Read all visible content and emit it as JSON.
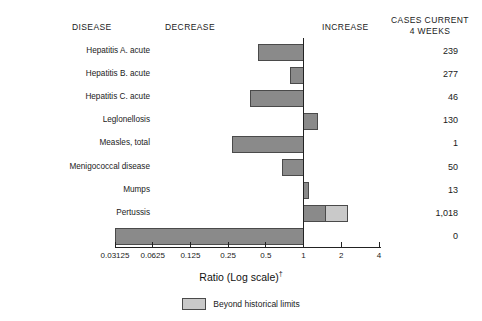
{
  "header": {
    "disease": "DISEASE",
    "decrease": "DECREASE",
    "increase": "INCREASE",
    "cases_line1": "CASES CURRENT",
    "cases_line2": "4 WEEKS"
  },
  "axis": {
    "title": "Ratio (Log scale)",
    "title_dagger": "†",
    "ticks": [
      "0.03125",
      "0.0625",
      "0.125",
      "0.25",
      "0.5",
      "1",
      "2",
      "4"
    ],
    "tick_values": [
      0.03125,
      0.0625,
      0.125,
      0.25,
      0.5,
      1,
      2,
      4
    ]
  },
  "legend": {
    "label": "Beyond historical limits",
    "swatch_color": "#c9c9c9"
  },
  "colors": {
    "bar": "#8a8a8a",
    "bar_border": "#4a4a4a",
    "beyond": "#c9c9c9",
    "axis": "#222222",
    "baseline": "#222222"
  },
  "chart_data": {
    "type": "bar",
    "orientation": "horizontal",
    "title": "",
    "xlabel": "Ratio (Log scale)†",
    "ylabel": "",
    "xscale": "log2",
    "xlim": [
      0.03125,
      4
    ],
    "baseline": 1,
    "grid": false,
    "legend_position": "bottom",
    "categories": [
      "Hepatitis A. acute",
      "Hepatitis B. acute",
      "Hepatitis C. acute",
      "Leglonellosis",
      "Measles, total",
      "Menigococcal disease",
      "Mumps",
      "Pertussis",
      "Rubella*"
    ],
    "cases_current_4_weeks": [
      "239",
      "277",
      "46",
      "130",
      "1",
      "50",
      "13",
      "1,018",
      "0"
    ],
    "values": [
      0.44,
      0.78,
      0.38,
      1.3,
      0.27,
      0.68,
      1.1,
      2.25,
      0.03125
    ],
    "series": [
      {
        "name": "Ratio",
        "values": [
          0.44,
          0.78,
          0.38,
          1.3,
          0.27,
          0.68,
          1.1,
          1.5,
          0.03125
        ]
      },
      {
        "name": "Beyond historical limits",
        "values": [
          null,
          null,
          null,
          null,
          null,
          null,
          null,
          2.25,
          null
        ]
      }
    ],
    "bars": [
      {
        "label": "Hepatitis A. acute",
        "cases": "239",
        "low": 0.44,
        "high": 1,
        "beyond_low": null,
        "beyond_high": null
      },
      {
        "label": "Hepatitis B. acute",
        "cases": "277",
        "low": 0.78,
        "high": 1,
        "beyond_low": null,
        "beyond_high": null
      },
      {
        "label": "Hepatitis C. acute",
        "cases": "46",
        "low": 0.38,
        "high": 1,
        "beyond_low": null,
        "beyond_high": null
      },
      {
        "label": "Leglonellosis",
        "cases": "130",
        "low": 1,
        "high": 1.3,
        "beyond_low": null,
        "beyond_high": null
      },
      {
        "label": "Measles, total",
        "cases": "1",
        "low": 0.27,
        "high": 1,
        "beyond_low": null,
        "beyond_high": null
      },
      {
        "label": "Menigococcal disease",
        "cases": "50",
        "low": 0.68,
        "high": 1,
        "beyond_low": null,
        "beyond_high": null
      },
      {
        "label": "Mumps",
        "cases": "13",
        "low": 1,
        "high": 1.1,
        "beyond_low": null,
        "beyond_high": null
      },
      {
        "label": "Pertussis",
        "cases": "1,018",
        "low": 1,
        "high": 1.5,
        "beyond_low": 1.5,
        "beyond_high": 2.25
      },
      {
        "label": "Rubella*",
        "cases": "0",
        "low": 0.03125,
        "high": 1,
        "beyond_low": null,
        "beyond_high": null
      }
    ]
  }
}
